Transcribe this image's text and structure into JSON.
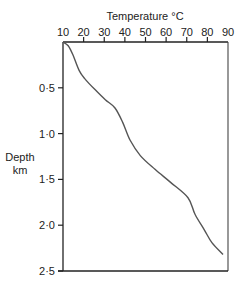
{
  "chart_data": {
    "type": "line",
    "title": "",
    "xlabel": "Temperature °C",
    "ylabel": "Depth km",
    "x_ticks": [
      "10",
      "20",
      "30",
      "40",
      "50",
      "60",
      "70",
      "80",
      "90"
    ],
    "y_ticks": [
      "0·5",
      "1·0",
      "1·5",
      "2·0",
      "2·5"
    ],
    "xlim": [
      10,
      90
    ],
    "ylim": [
      0,
      2.5
    ],
    "y_inverted": true,
    "x_axis_position": "top",
    "grid": false,
    "series": [
      {
        "name": "Temperature profile",
        "x": [
          10,
          12.5,
          14.8,
          17.8,
          20.5,
          25.5,
          30.5,
          35.2,
          39,
          42.5,
          47.5,
          54.6,
          62,
          70.6,
          74,
          78.5,
          82.2,
          87.6
        ],
        "y": [
          0,
          0.04,
          0.14,
          0.31,
          0.4,
          0.52,
          0.63,
          0.72,
          0.88,
          1.07,
          1.24,
          1.39,
          1.53,
          1.7,
          1.88,
          2.05,
          2.19,
          2.32
        ]
      }
    ]
  },
  "labels": {
    "x_title": "Temperature °C",
    "y_title_line1": "Depth",
    "y_title_line2": "km"
  }
}
